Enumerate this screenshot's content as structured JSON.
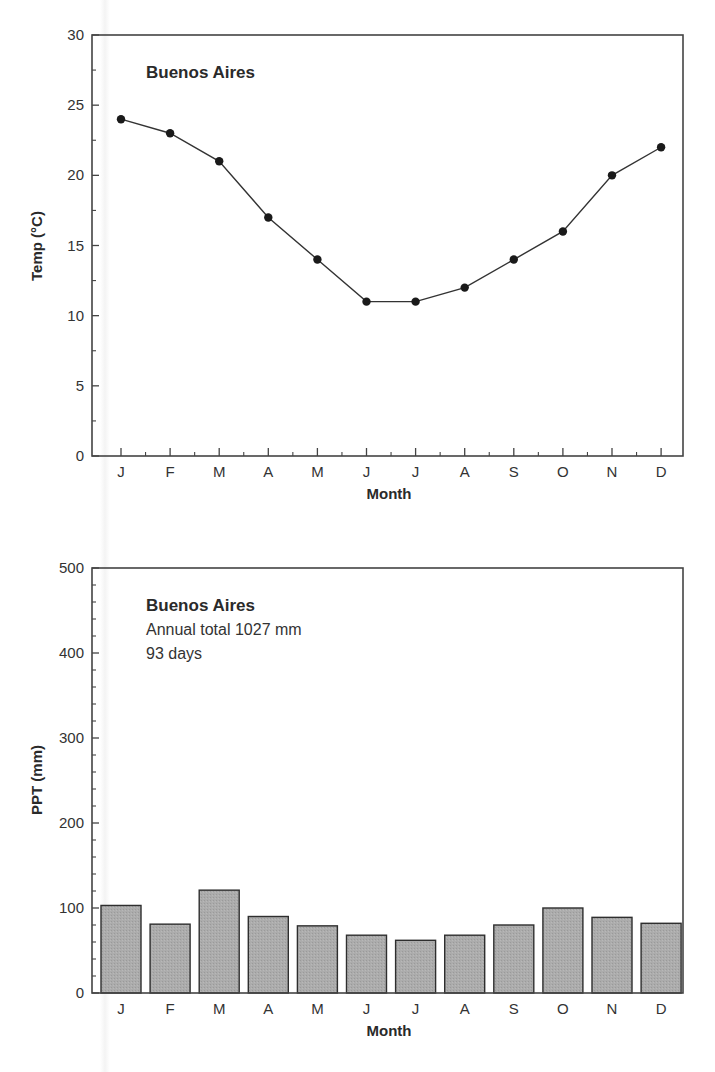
{
  "chart_data": [
    {
      "type": "line",
      "title": "Buenos Aires",
      "xlabel": "Month",
      "ylabel": "Temp (°C)",
      "categories": [
        "J",
        "F",
        "M",
        "A",
        "M",
        "J",
        "J",
        "A",
        "S",
        "O",
        "N",
        "D"
      ],
      "values": [
        24,
        23,
        21,
        17,
        14,
        11,
        11,
        12,
        14,
        16,
        20,
        22
      ],
      "ylim": [
        0,
        30
      ],
      "yticks": [
        0,
        5,
        10,
        15,
        20,
        25,
        30
      ],
      "grid": false,
      "marker": "filled-circle",
      "line_color": "#333333"
    },
    {
      "type": "bar",
      "title": "Buenos Aires",
      "subtitle": [
        "Annual total 1027 mm",
        "93 days"
      ],
      "xlabel": "Month",
      "ylabel": "PPT (mm)",
      "categories": [
        "J",
        "F",
        "M",
        "A",
        "M",
        "J",
        "J",
        "A",
        "S",
        "O",
        "N",
        "D"
      ],
      "values": [
        103,
        81,
        121,
        90,
        79,
        68,
        62,
        68,
        80,
        100,
        89,
        82
      ],
      "ylim": [
        0,
        500
      ],
      "yticks": [
        0,
        100,
        200,
        300,
        400,
        500
      ],
      "grid": false,
      "bar_color": "#a9a9a9",
      "bar_edge_color": "#2e2e2e"
    }
  ],
  "temp_chart": {
    "title": "Buenos Aires",
    "xlabel": "Month",
    "ylabel": "Temp (°C)",
    "ytick_labels": [
      "0",
      "5",
      "10",
      "15",
      "20",
      "25",
      "30"
    ],
    "xtick_labels": [
      "J",
      "F",
      "M",
      "A",
      "M",
      "J",
      "J",
      "A",
      "S",
      "O",
      "N",
      "D"
    ]
  },
  "ppt_chart": {
    "title": "Buenos Aires",
    "annual_total": "Annual total 1027 mm",
    "days": "93 days",
    "xlabel": "Month",
    "ylabel": "PPT (mm)",
    "ytick_labels": [
      "0",
      "100",
      "200",
      "300",
      "400",
      "500"
    ],
    "xtick_labels": [
      "J",
      "F",
      "M",
      "A",
      "M",
      "J",
      "J",
      "A",
      "S",
      "O",
      "N",
      "D"
    ]
  }
}
